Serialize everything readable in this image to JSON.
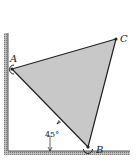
{
  "diagram": {
    "points": {
      "A": {
        "label": "A",
        "x": 12,
        "y": 69
      },
      "B": {
        "label": "B",
        "x": 88,
        "y": 147
      },
      "C": {
        "label": "C",
        "x": 116,
        "y": 39
      }
    },
    "angle_label": "45°",
    "colors": {
      "plate_fill": "#c8c8c8",
      "outline": "#222222",
      "hatch": "#888888"
    }
  }
}
